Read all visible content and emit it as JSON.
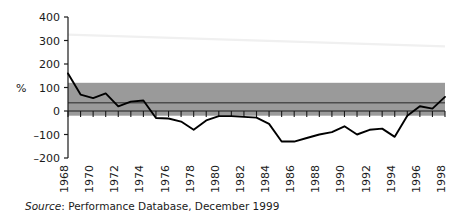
{
  "figure": {
    "source_prefix": "Source",
    "source_text": ": Performance Database, December 1999"
  },
  "chart_data": {
    "type": "line",
    "title": "",
    "xlabel": "",
    "ylabel": "%",
    "ylim": [
      -200,
      400
    ],
    "xlim": [
      1968,
      1998
    ],
    "yticks": [
      -200,
      -100,
      0,
      100,
      200,
      300,
      400
    ],
    "ytick_labels": [
      "–200",
      "–100",
      "0",
      "100",
      "200",
      "300",
      "400"
    ],
    "grid": false,
    "legend": "none",
    "x": [
      1968,
      1969,
      1970,
      1971,
      1972,
      1973,
      1974,
      1975,
      1976,
      1977,
      1978,
      1979,
      1980,
      1981,
      1982,
      1983,
      1984,
      1985,
      1986,
      1987,
      1988,
      1989,
      1990,
      1991,
      1992,
      1993,
      1994,
      1995,
      1996,
      1997,
      1998
    ],
    "xtick_labels": [
      "1968",
      "1970",
      "1972",
      "1974",
      "1976",
      "1978",
      "1980",
      "1982",
      "1984",
      "1986",
      "1988",
      "1990",
      "1992",
      "1994",
      "1996",
      "1998"
    ],
    "xtick_label_years": [
      1968,
      1970,
      1972,
      1974,
      1976,
      1978,
      1980,
      1982,
      1984,
      1986,
      1988,
      1990,
      1992,
      1994,
      1996,
      1998
    ],
    "series": [
      {
        "name": "% change",
        "color": "#000000",
        "values": [
          160,
          70,
          55,
          75,
          20,
          40,
          45,
          -30,
          -32,
          -45,
          -80,
          -40,
          -22,
          -22,
          -25,
          -28,
          -55,
          -130,
          -130,
          -115,
          -100,
          -90,
          -65,
          -100,
          -80,
          -75,
          -110,
          -20,
          20,
          10,
          60
        ]
      }
    ],
    "band": {
      "name": "reference band",
      "upper": 120,
      "lower": -20,
      "midline": 35,
      "fill_color": "#9a9a9a",
      "midline_color": "#4d4d4d"
    },
    "faint_line": {
      "name": "faint guide line",
      "from": [
        1968,
        325
      ],
      "to": [
        1998,
        275
      ],
      "color": "#f0f0f0"
    }
  }
}
